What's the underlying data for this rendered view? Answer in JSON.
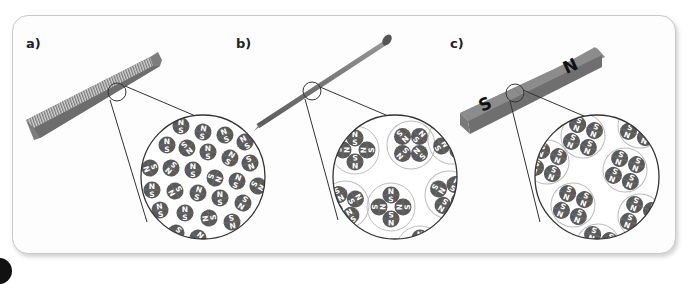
{
  "figure": {
    "panels": [
      {
        "label": "a)",
        "object": "comb",
        "description": "Unmagnetized object: magnetic domains randomly oriented",
        "domain_arrangement": "random"
      },
      {
        "label": "b)",
        "object": "nail",
        "description": "Domains grouped in clusters with opposing orientations (net zero)",
        "domain_arrangement": "grouped-cancelling"
      },
      {
        "label": "c)",
        "object": "bar magnet",
        "description": "Magnetized: domains aligned in the same direction",
        "domain_arrangement": "aligned",
        "pole_labels": {
          "south": "S",
          "north": "N"
        }
      }
    ],
    "domain_pole_labels": {
      "north": "N",
      "south": "S"
    },
    "colors": {
      "domain_fill": "#5a5a5a",
      "domain_text": "#ffffff",
      "cluster_outline": "#bdbdbd",
      "magnifier_outline": "#333333",
      "frame_border": "#c9c9c9",
      "object_gray": "#8c8c8c"
    }
  }
}
